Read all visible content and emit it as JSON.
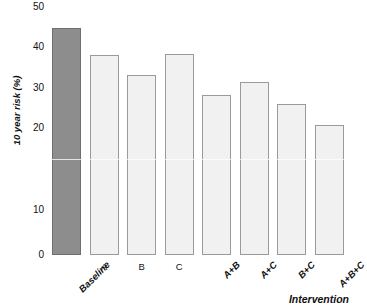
{
  "chart_data": {
    "type": "bar",
    "title": "",
    "xlabel": "Intervention",
    "ylabel": "10 year risk (%)",
    "categories": [
      "Baseline",
      "A",
      "B",
      "C",
      "A+B",
      "A+C",
      "B+C",
      "A+B+C"
    ],
    "values": [
      45.5,
      40.0,
      36.0,
      40.3,
      32.0,
      34.7,
      30.3,
      26.0
    ],
    "ylim": [
      0,
      50
    ],
    "yticks": [
      0,
      10,
      20,
      30,
      40,
      50
    ],
    "ytick_labels": [
      "0",
      "10",
      "20",
      "30",
      "40",
      "50"
    ],
    "grid": false,
    "legend": "none",
    "bar_colors": {
      "default_fill": "#f1f1f1",
      "default_border": "#9a9a9a",
      "highlight_fill": "#8d8d8d",
      "highlight_border": "#6e6e6e"
    },
    "highlight_index": 0,
    "series": [
      {
        "name": "10 year risk (%)",
        "values": [
          45.5,
          40.0,
          36.0,
          40.3,
          32.0,
          34.7,
          30.3,
          26.0
        ]
      }
    ]
  },
  "axes": {
    "y_title": "10 year risk (%)",
    "x_title": "Intervention"
  },
  "header": {
    "cropped_title": ""
  }
}
